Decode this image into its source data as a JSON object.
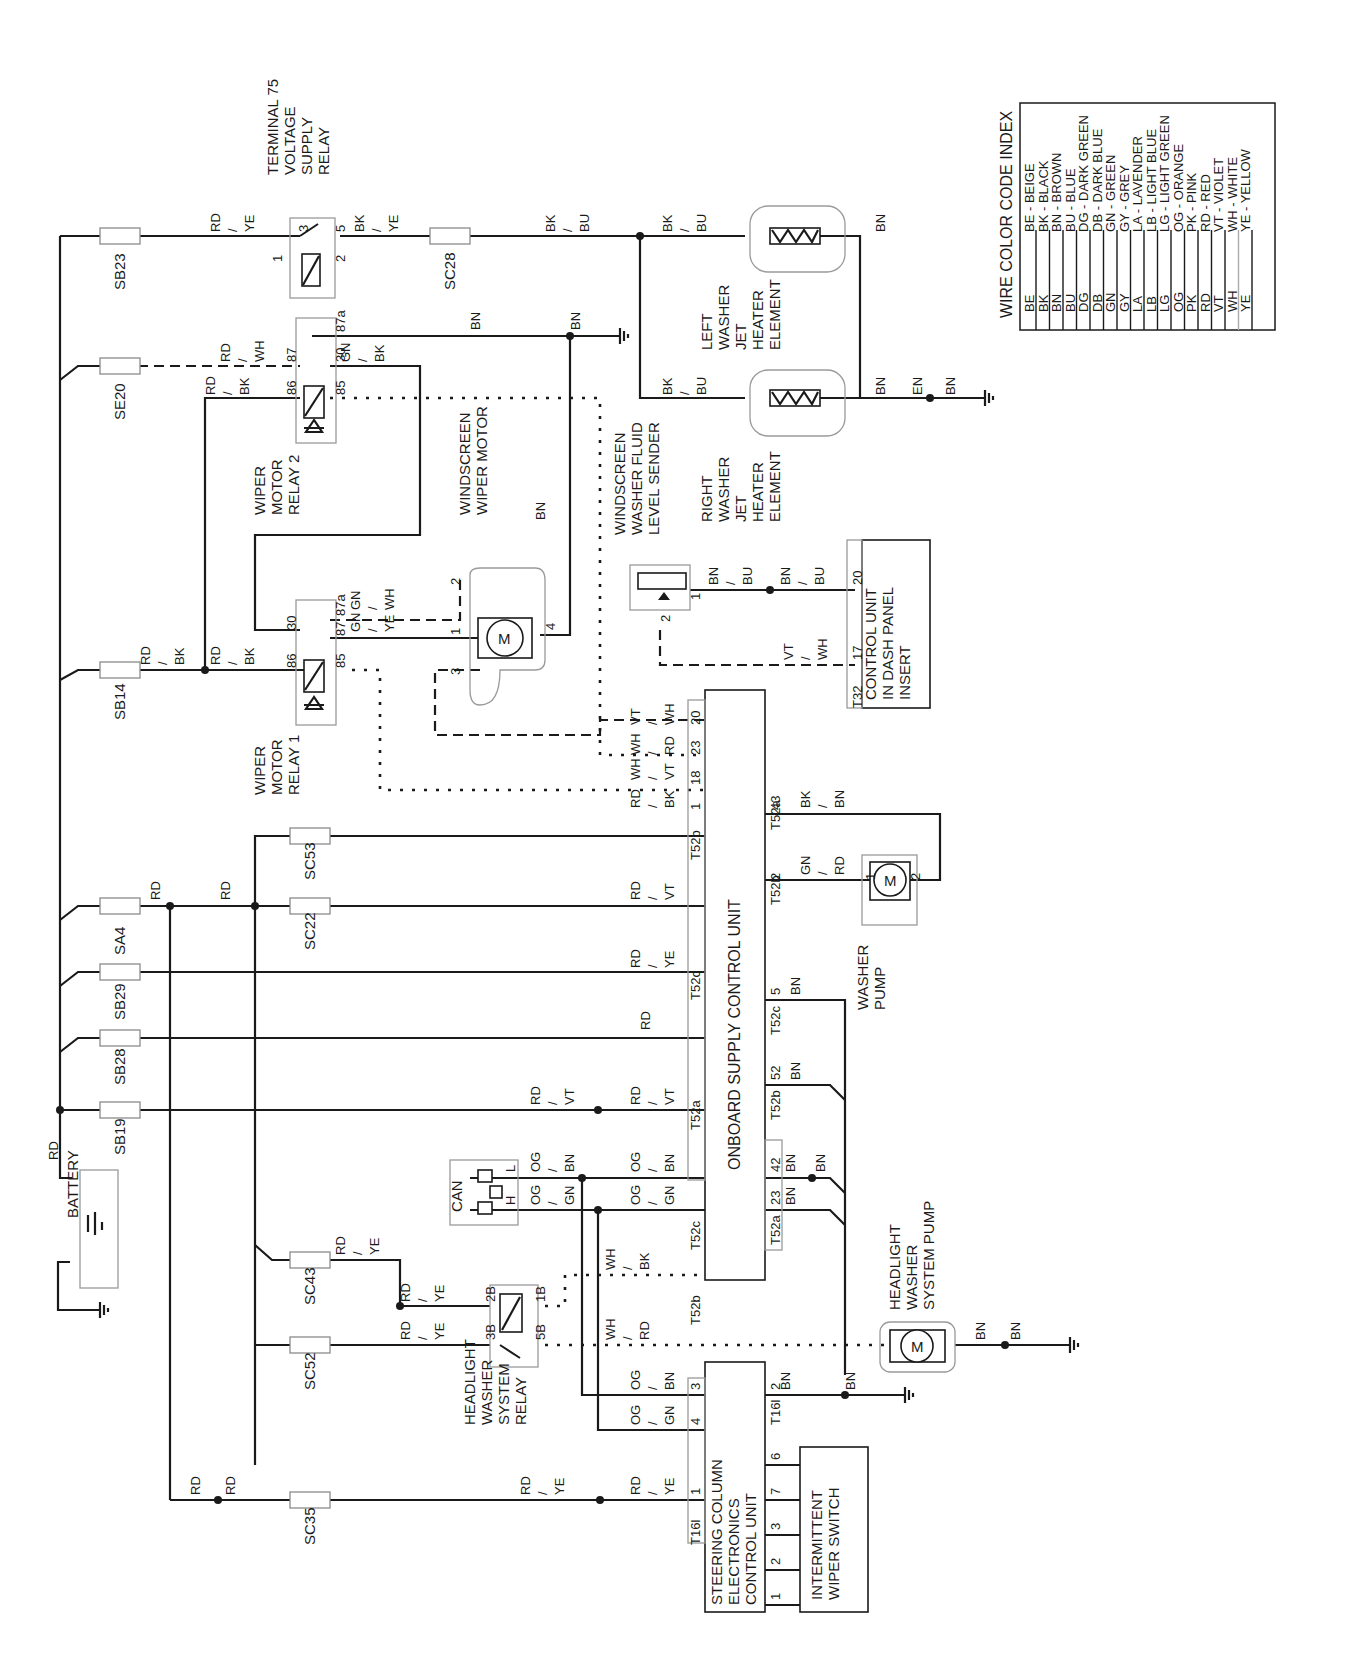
{
  "legend": {
    "title": "WIRE COLOR CODE INDEX",
    "entries": [
      {
        "code": "BE",
        "desc": "BE - BEIGE"
      },
      {
        "code": "BK",
        "desc": "BK - BLACK"
      },
      {
        "code": "BN",
        "desc": "BN - BROWN"
      },
      {
        "code": "BU",
        "desc": "BU - BLUE"
      },
      {
        "code": "DG",
        "desc": "DG - DARK GREEN"
      },
      {
        "code": "DB",
        "desc": "DB - DARK BLUE"
      },
      {
        "code": "GN",
        "desc": "GN - GREEN"
      },
      {
        "code": "GY",
        "desc": "GY - GREY"
      },
      {
        "code": "LA",
        "desc": "LA - LAVENDER"
      },
      {
        "code": "LB",
        "desc": "LB - LIGHT BLUE"
      },
      {
        "code": "LG",
        "desc": "LG - LIGHT GREEN"
      },
      {
        "code": "OG",
        "desc": "OG - ORANGE"
      },
      {
        "code": "PK",
        "desc": "PK - PINK"
      },
      {
        "code": "RD",
        "desc": "RD - RED"
      },
      {
        "code": "VT",
        "desc": "VT - VIOLET"
      },
      {
        "code": "WH",
        "desc": "WH - WHITE"
      },
      {
        "code": "YE",
        "desc": "YE - YELLOW"
      }
    ]
  },
  "components": {
    "battery": "BATTERY",
    "t75_relay": [
      "TERMINAL 75",
      "VOLTAGE",
      "SUPPLY",
      "RELAY"
    ],
    "wiper_relay_2": [
      "WIPER",
      "MOTOR",
      "RELAY 2"
    ],
    "wiper_relay_1": [
      "WIPER",
      "MOTOR",
      "RELAY 1"
    ],
    "wiper_motor": [
      "WINDSCREEN",
      "WIPER MOTOR"
    ],
    "fluid_sender": [
      "WINDSCREEN",
      "WASHER FLUID",
      "LEVEL SENDER"
    ],
    "left_heater": [
      "LEFT",
      "WASHER",
      "JET",
      "HEATER",
      "ELEMENT"
    ],
    "right_heater": [
      "RIGHT",
      "WASHER",
      "JET",
      "HEATER",
      "ELEMENT"
    ],
    "dash_unit": [
      "CONTROL UNIT",
      "IN DASH PANEL",
      "INSERT"
    ],
    "onboard_unit": "ONBOARD SUPPLY CONTROL UNIT",
    "washer_pump": [
      "WASHER",
      "PUMP"
    ],
    "headlight_pump": [
      "HEADLIGHT",
      "WASHER",
      "SYSTEM PUMP"
    ],
    "headlight_relay": [
      "HEADLIGHT",
      "WASHER",
      "SYSTEM",
      "RELAY"
    ],
    "steering_unit": [
      "STEERING COLUMN",
      "ELECTRONICS",
      "CONTROL UNIT"
    ],
    "intermittent_switch": [
      "INTERMITTENT",
      "WIPER SWITCH"
    ],
    "can": "CAN",
    "motor_symbol": "M"
  },
  "fuses": {
    "sb23": "SB23",
    "se20": "SE20",
    "sb14": "SB14",
    "sa4": "SA4",
    "sb29": "SB29",
    "sb28": "SB28",
    "sb19": "SB19",
    "sc28": "SC28",
    "sc53": "SC53",
    "sc22": "SC22",
    "sc43": "SC43",
    "sc52": "SC52",
    "sc35": "SC35"
  },
  "connectors": {
    "t52a": "T52a",
    "t52b": "T52b",
    "t52c": "T52c",
    "t32": "T32",
    "t16l": "T16l"
  },
  "wires": {
    "rd": "RD",
    "bn": "BN",
    "rd_ye": "RD / YE",
    "bk_ye": "BK / YE",
    "bk_bu": "BK / BU",
    "rd_bk": "RD / BK",
    "rd_wh": "RD / WH",
    "gn_bk": "GN / BK",
    "gn_wh": "GN / WH",
    "gn_ye": "GN / YE",
    "bn_bu": "BN / BU",
    "vt_wh": "VT / WH",
    "wh_vt": "WH / VT",
    "wh_rd": "WH / RD",
    "rd_vt": "RD / VT",
    "og_bn": "OG / BN",
    "og_gn": "OG / GN",
    "wh_bk": "WH / BK",
    "bk_bn": "BK / BN",
    "gn_rd": "GN / RD",
    "en": "EN"
  },
  "pins": {
    "t75": [
      "3",
      "5",
      "1",
      "2"
    ],
    "relay2": [
      "87",
      "87a",
      "86",
      "30",
      "85"
    ],
    "relay1": [
      "87a",
      "30",
      "87",
      "86",
      "85"
    ],
    "motor": [
      "2",
      "1",
      "3",
      "4"
    ],
    "sender": [
      "1",
      "2"
    ],
    "heater": [
      "1",
      "2"
    ],
    "dash": [
      "20",
      "17"
    ],
    "onboard_top": [
      "1",
      "18",
      "23",
      "20"
    ],
    "onboard_left": [
      "1",
      "5",
      "42",
      "1",
      "24",
      "16",
      "15",
      "40"
    ],
    "onboard_right": [
      "43",
      "2",
      "5",
      "52",
      "42",
      "23"
    ],
    "pump": [
      "1",
      "2"
    ],
    "hl_relay": [
      "2B",
      "1B",
      "3B",
      "5B"
    ],
    "steering_left": [
      "3",
      "4",
      "1"
    ],
    "steering_right": [
      "2",
      "6",
      "7",
      "3",
      "2",
      "1"
    ],
    "can": [
      "L",
      "H"
    ]
  }
}
